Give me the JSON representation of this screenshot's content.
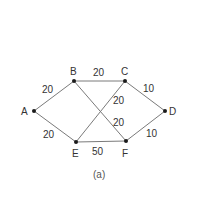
{
  "diagram": {
    "type": "weighted-graph",
    "caption": "(a)",
    "nodes": [
      {
        "id": "A",
        "label": "A"
      },
      {
        "id": "B",
        "label": "B"
      },
      {
        "id": "C",
        "label": "C"
      },
      {
        "id": "D",
        "label": "D"
      },
      {
        "id": "E",
        "label": "E"
      },
      {
        "id": "F",
        "label": "F"
      }
    ],
    "edges": [
      {
        "from": "A",
        "to": "B",
        "weight": "20"
      },
      {
        "from": "A",
        "to": "E",
        "weight": "20"
      },
      {
        "from": "B",
        "to": "C",
        "weight": "20"
      },
      {
        "from": "B",
        "to": "F",
        "weight": "20"
      },
      {
        "from": "E",
        "to": "C",
        "weight": "20"
      },
      {
        "from": "E",
        "to": "F",
        "weight": "50"
      },
      {
        "from": "C",
        "to": "D",
        "weight": "10"
      },
      {
        "from": "F",
        "to": "D",
        "weight": "10"
      }
    ]
  }
}
